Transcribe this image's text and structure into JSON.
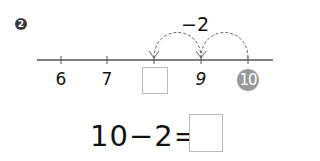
{
  "problem": {
    "number": "2",
    "jump_label": "−2",
    "number_line": {
      "ticks": [
        {
          "label": "6",
          "x": 61
        },
        {
          "label": "7",
          "x": 107
        },
        {
          "label": "",
          "x": 154,
          "is_blank": true
        },
        {
          "label": "9",
          "x": 201
        },
        {
          "label": "10",
          "x": 248,
          "highlighted": true
        }
      ],
      "jumps": [
        {
          "from": "10",
          "to": "9"
        },
        {
          "from": "9",
          "to": "blank"
        }
      ]
    },
    "equation": {
      "left": "10",
      "operator": "−",
      "right": "2",
      "equals": "=",
      "answer": ""
    }
  },
  "colors": {
    "line": "#555555",
    "highlight_circle": "#9a9a9a",
    "badge": "#3a3a3a",
    "box_border": "#b8b8b8"
  }
}
